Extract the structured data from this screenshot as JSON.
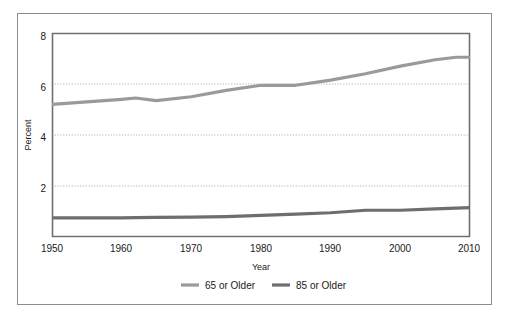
{
  "figure": {
    "background": "#ffffff",
    "frame_color": "#8d8d8d"
  },
  "chart_data": {
    "type": "line",
    "title": "",
    "xlabel": "Year",
    "ylabel": "Percent",
    "xlim": [
      1950,
      2010
    ],
    "ylim": [
      0,
      8
    ],
    "xticks": [
      1950,
      1960,
      1970,
      1980,
      1990,
      2000,
      2010
    ],
    "xtick_labels": [
      "1950",
      "1960",
      "1970",
      "1980",
      "1990",
      "2000",
      "2010"
    ],
    "yticks": [
      2,
      4,
      6,
      8
    ],
    "ytick_labels": [
      "2",
      "4",
      "6",
      "8"
    ],
    "grid": {
      "horizontal": true,
      "vertical": false,
      "style": "dotted",
      "color": "#b4b4b4",
      "at": [
        2,
        4,
        6
      ]
    },
    "legend": {
      "position": "below-axes",
      "entries": [
        {
          "name": "65 or Older",
          "color": "#9a9a9a"
        },
        {
          "name": "85 or Older",
          "color": "#6e6e6e"
        }
      ]
    },
    "x": [
      1950,
      1955,
      1960,
      1962,
      1965,
      1970,
      1975,
      1980,
      1985,
      1990,
      1995,
      2000,
      2005,
      2008,
      2010
    ],
    "series": [
      {
        "name": "65 or Older",
        "color": "#9a9a9a",
        "linewidth": 3,
        "values": [
          5.2,
          5.3,
          5.4,
          5.45,
          5.35,
          5.5,
          5.75,
          5.95,
          5.95,
          6.15,
          6.4,
          6.7,
          6.95,
          7.05,
          7.05
        ]
      },
      {
        "name": "85 or Older",
        "color": "#6e6e6e",
        "linewidth": 3,
        "values": [
          0.75,
          0.75,
          0.75,
          0.76,
          0.77,
          0.78,
          0.8,
          0.85,
          0.9,
          0.95,
          1.05,
          1.05,
          1.1,
          1.13,
          1.15
        ]
      }
    ]
  }
}
